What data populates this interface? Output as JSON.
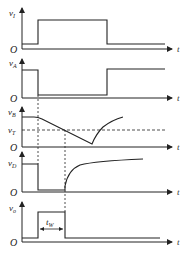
{
  "diagram": {
    "type": "timing-waveforms",
    "panels": [
      {
        "id": "vI",
        "label": "v",
        "subscript": "I",
        "origin": "O",
        "time_axis": "t"
      },
      {
        "id": "vA",
        "label": "v",
        "subscript": "A",
        "origin": "O",
        "time_axis": "t"
      },
      {
        "id": "vB",
        "label": "v",
        "subscript": "B",
        "origin": "O",
        "time_axis": "t",
        "threshold_label": "v",
        "threshold_subscript": "T"
      },
      {
        "id": "vD",
        "label": "v",
        "subscript": "D",
        "origin": "O",
        "time_axis": "t"
      },
      {
        "id": "vO",
        "label": "v",
        "subscript": "o",
        "origin": "O",
        "time_axis": "t",
        "pulse_width_label": "t",
        "pulse_width_subscript": "W"
      }
    ]
  }
}
